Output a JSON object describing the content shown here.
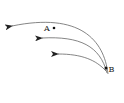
{
  "diagram": {
    "points": [
      {
        "label": "A",
        "x": 54,
        "y": 28
      },
      {
        "label": "B",
        "x": 106,
        "y": 68
      }
    ],
    "arrows": [
      {
        "name": "outer-arc",
        "path": "M108,74 C104,40 80,12 12,26",
        "arrow_tip": [
          11,
          26
        ]
      },
      {
        "name": "middle-arc",
        "path": "M107,73 C100,46 80,36 42,38",
        "arrow_tip": [
          41,
          38
        ]
      },
      {
        "name": "inner-arc",
        "path": "M106,71 C96,60 82,54 58,54",
        "arrow_tip": [
          58,
          54
        ]
      }
    ],
    "colors": {
      "stroke": "#555555",
      "point": "#111111",
      "text": "#222222"
    }
  }
}
